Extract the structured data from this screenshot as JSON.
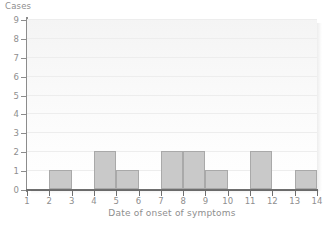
{
  "chart_data": {
    "type": "bar",
    "title": "",
    "subtitle": "",
    "xlabel": "Date of onset of symptoms",
    "ylabel": "Cases",
    "x_tick_labels": [
      "1",
      "2",
      "3",
      "4",
      "5",
      "6",
      "7",
      "8",
      "9",
      "10",
      "11",
      "12",
      "13",
      "14"
    ],
    "y_tick_labels": [
      "0",
      "1",
      "2",
      "3",
      "4",
      "5",
      "6",
      "7",
      "8",
      "9"
    ],
    "xlim": [
      1,
      14
    ],
    "ylim": [
      0,
      9
    ],
    "grid": true,
    "legend": null,
    "bin_width": 1,
    "note": "Epidemic curve histogram; each bar spans one day interval between adjacent ticks.",
    "bins": [
      {
        "start": 1,
        "end": 2,
        "value": 0
      },
      {
        "start": 2,
        "end": 3,
        "value": 1
      },
      {
        "start": 3,
        "end": 4,
        "value": 0
      },
      {
        "start": 4,
        "end": 5,
        "value": 2
      },
      {
        "start": 5,
        "end": 6,
        "value": 1
      },
      {
        "start": 6,
        "end": 7,
        "value": 0
      },
      {
        "start": 7,
        "end": 8,
        "value": 2
      },
      {
        "start": 8,
        "end": 9,
        "value": 2
      },
      {
        "start": 9,
        "end": 10,
        "value": 1
      },
      {
        "start": 10,
        "end": 11,
        "value": 0
      },
      {
        "start": 11,
        "end": 12,
        "value": 2
      },
      {
        "start": 12,
        "end": 13,
        "value": 0
      },
      {
        "start": 13,
        "end": 14,
        "value": 1
      }
    ],
    "categories": [
      "1-2",
      "2-3",
      "3-4",
      "4-5",
      "5-6",
      "6-7",
      "7-8",
      "8-9",
      "9-10",
      "10-11",
      "11-12",
      "12-13",
      "13-14"
    ],
    "values": [
      0,
      1,
      0,
      2,
      1,
      0,
      2,
      2,
      1,
      0,
      2,
      0,
      1
    ],
    "total_cases": 12,
    "colors": {
      "bar_fill": "#c9c9c9",
      "bar_stroke": "#a9a9a9",
      "axis": "#6f6f6f",
      "text": "#8e8e8e",
      "grid": "#ededed",
      "plot_background": "#f7f7f7",
      "page_background": "#ffffff"
    }
  }
}
